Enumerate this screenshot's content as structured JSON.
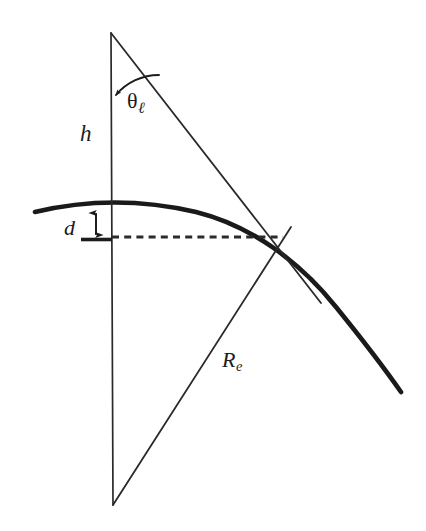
{
  "figure": {
    "background_color": "#ffffff",
    "ink_color": "#1c1c1c",
    "width": 426,
    "height": 531
  },
  "labels": {
    "height": {
      "text": "h",
      "meaning": "antenna height above the surface"
    },
    "angle": {
      "symbol": "θ",
      "subscript": "ℓ",
      "meaning": "line-of-sight angle from vertical"
    },
    "drop": {
      "text": "d",
      "meaning": "bulge of the earth surface above the chord"
    },
    "radius": {
      "symbol": "R",
      "subscript": "e",
      "meaning": "effective earth radius"
    }
  },
  "geometry": {
    "apex": {
      "x": 111,
      "y": 33
    },
    "center": {
      "x": 113,
      "y": 505
    },
    "tangent_point": {
      "x": 282,
      "y": 237
    },
    "vertical_line": {
      "x1": 111,
      "y1": 33,
      "x2": 113,
      "y2": 505
    },
    "slant_upper": {
      "x1": 111,
      "y1": 33,
      "x2": 320,
      "y2": 302
    },
    "radius_line": {
      "x1": 113,
      "y1": 505,
      "x2": 290,
      "y2": 228
    },
    "dashed_line": {
      "x1": 112,
      "y1": 237,
      "x2": 283,
      "y2": 237
    },
    "arc_start": {
      "x": 35,
      "y": 212
    },
    "arc_end": {
      "x": 401,
      "y": 392
    },
    "arc_peak": {
      "x": 168,
      "y": 204
    },
    "d_arrow": {
      "x": 96,
      "y_top": 211,
      "y_bottom": 236
    },
    "angle_arc": {
      "center_x": 111,
      "center_y": 33,
      "radius": 62
    }
  },
  "elements": {
    "surface_curve_name": "earth-surface-arc",
    "dashed_name": "chord-dashed-line",
    "vertical_name": "height-vertical-line",
    "slant_name": "line-of-sight-line",
    "radius_name": "earth-radius-line",
    "angle_arc_name": "theta-angle-arc",
    "d_arrow_name": "d-measure-arrow"
  }
}
